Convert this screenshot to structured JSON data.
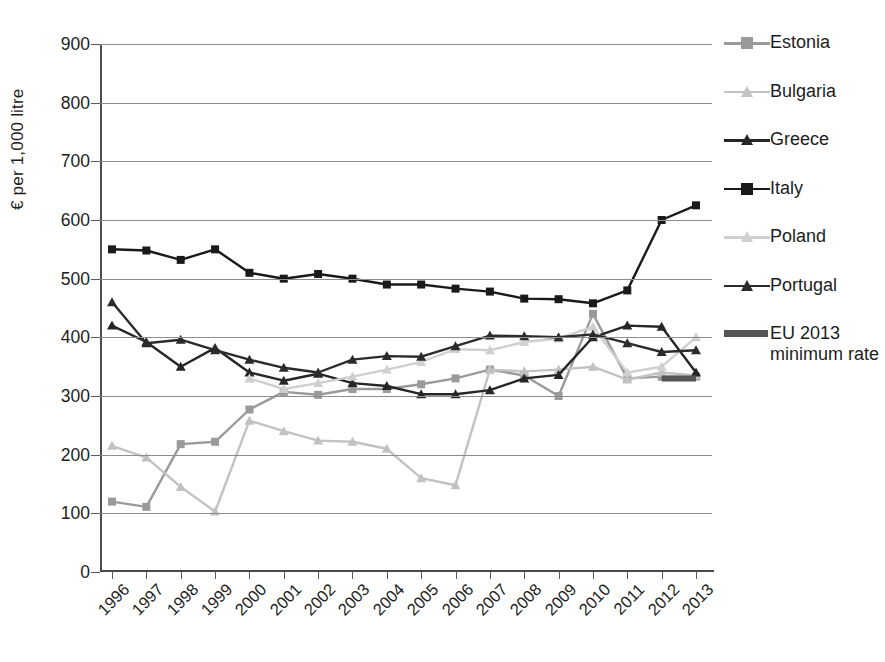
{
  "chart_data": {
    "type": "line",
    "title": "",
    "xlabel": "",
    "ylabel": "€ per 1,000 litre",
    "ylim": [
      0,
      900
    ],
    "ytick_step": 100,
    "grid": true,
    "legend_position": "right",
    "categories": [
      "1996",
      "1997",
      "1998",
      "1999",
      "2000",
      "2001",
      "2002",
      "2003",
      "2004",
      "2005",
      "2006",
      "2007",
      "2008",
      "2009",
      "2010",
      "2011",
      "2012",
      "2013"
    ],
    "yticks": [
      "0",
      "100",
      "200",
      "300",
      "400",
      "500",
      "600",
      "700",
      "800",
      "900"
    ],
    "series": [
      {
        "name": "Estonia",
        "color": "#9a9a9a",
        "marker": "square",
        "values": [
          120,
          111,
          218,
          222,
          277,
          307,
          302,
          312,
          312,
          320,
          330,
          345,
          335,
          300,
          440,
          330,
          333,
          333
        ]
      },
      {
        "name": "Bulgaria",
        "color": "#c2c2c2",
        "marker": "triangle",
        "values": [
          215,
          195,
          145,
          103,
          258,
          240,
          224,
          222,
          210,
          160,
          148,
          345,
          342,
          345,
          350,
          328,
          340,
          335
        ]
      },
      {
        "name": "Greece",
        "color": "#262626",
        "marker": "triangle",
        "values": [
          420,
          392,
          350,
          382,
          340,
          326,
          338,
          322,
          317,
          303,
          303,
          310,
          330,
          336,
          400,
          420,
          418,
          340
        ]
      },
      {
        "name": "Italy",
        "color": "#1a1a1a",
        "marker": "square",
        "values": [
          550,
          548,
          532,
          550,
          510,
          500,
          508,
          500,
          490,
          490,
          483,
          478,
          466,
          465,
          458,
          480,
          600,
          625
        ]
      },
      {
        "name": "Poland",
        "color": "#cfcfcf",
        "marker": "triangle",
        "values": [
          null,
          null,
          null,
          null,
          330,
          312,
          322,
          333,
          345,
          358,
          380,
          378,
          392,
          398,
          418,
          340,
          350,
          400
        ]
      },
      {
        "name": "Portugal",
        "color": "#2b2b2b",
        "marker": "triangle",
        "values": [
          460,
          390,
          396,
          378,
          362,
          348,
          340,
          362,
          368,
          367,
          385,
          403,
          402,
          400,
          405,
          390,
          375,
          378
        ]
      },
      {
        "name": "EU 2013 minimum rate",
        "color": "#555555",
        "marker": "band",
        "value": 330,
        "span_start": "2012",
        "span_end": "2013"
      }
    ]
  },
  "legend": {
    "items": [
      {
        "label": "Estonia"
      },
      {
        "label": "Bulgaria"
      },
      {
        "label": "Greece"
      },
      {
        "label": "Italy"
      },
      {
        "label": "Poland"
      },
      {
        "label": "Portugal"
      },
      {
        "label": "EU 2013 minimum rate"
      }
    ]
  }
}
